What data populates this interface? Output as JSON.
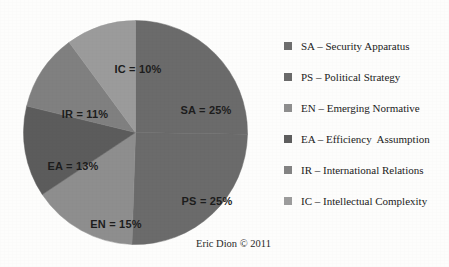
{
  "attribution": "Eric Dion © 2011",
  "background_color": "#fdfdfc",
  "chart_data": {
    "type": "pie",
    "title": "",
    "subtitle": "",
    "xlabel": "",
    "ylabel": "",
    "grid": false,
    "legend_position": "right",
    "start_angle_deg": 0,
    "direction": "clockwise",
    "categories": [
      "SA",
      "PS",
      "EN",
      "EA",
      "IR",
      "IC"
    ],
    "values": [
      25,
      25,
      15,
      13,
      11,
      10
    ],
    "value_unit": "%",
    "slices": [
      {
        "key": "SA",
        "label": "SA = 25%",
        "value": 25,
        "color": "#6b6b6b",
        "legend_label": "SA – Security Apparatus",
        "legend_swatch_color": "#6e6e6e",
        "label_x": 183,
        "label_y": 90
      },
      {
        "key": "PS",
        "label": "PS = 25%",
        "value": 25,
        "color": "#6b6b6b",
        "legend_label": "PS – Political Strategy",
        "legend_swatch_color": "#6a6a6a",
        "label_x": 184,
        "label_y": 181
      },
      {
        "key": "EN",
        "label": "EN = 15%",
        "value": 15,
        "color": "#8e8e8e",
        "legend_label": "EN – Emerging Normative",
        "legend_swatch_color": "#8e8e8e",
        "label_x": 93,
        "label_y": 204
      },
      {
        "key": "EA",
        "label": "EA = 13%",
        "value": 13,
        "color": "#5c5c5c",
        "legend_label": "EA – Efficiency  Assumption",
        "legend_swatch_color": "#5e5e5e",
        "label_x": 50,
        "label_y": 146
      },
      {
        "key": "IR",
        "label": "IR = 11%",
        "value": 11,
        "color": "#808080",
        "legend_label": "IR – International Relations",
        "legend_swatch_color": "#838383",
        "label_x": 62,
        "label_y": 94
      },
      {
        "key": "IC",
        "label": "IC = 10%",
        "value": 10,
        "color": "#9b9b9b",
        "legend_label": "IC – Intellectual Complexity",
        "legend_swatch_color": "#9c9c9c",
        "label_x": 115,
        "label_y": 49
      }
    ],
    "legend": [
      "SA – Security Apparatus",
      "PS – Political Strategy",
      "EN – Emerging Normative",
      "EA – Efficiency  Assumption",
      "IR – International Relations",
      "IC – Intellectual Complexity"
    ]
  }
}
